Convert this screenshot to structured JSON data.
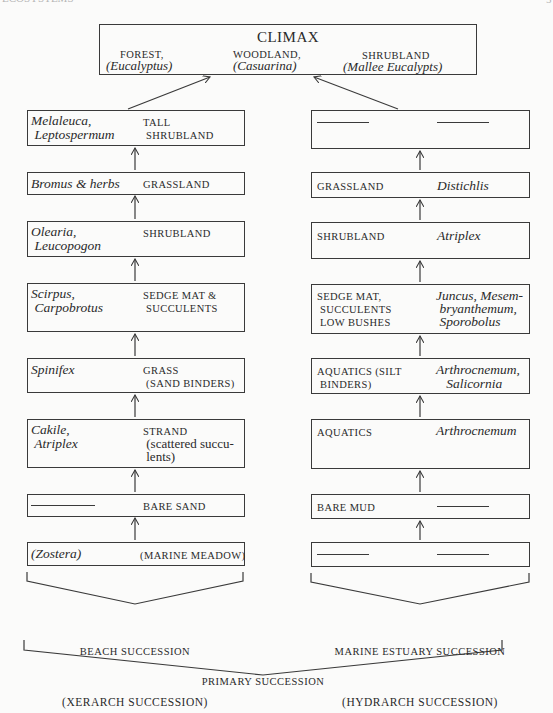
{
  "page": {
    "header_left_fragment": "ECOSYSTEMS",
    "header_right_fragment": "5"
  },
  "climax": {
    "title": "CLIMAX",
    "items": [
      {
        "type": "FOREST,",
        "genus": "(Eucalyptus)"
      },
      {
        "type": "WOODLAND,",
        "genus": "(Casuarina)"
      },
      {
        "type": "SHRUBLAND",
        "genus": "(Mallee Eucalypts)"
      }
    ]
  },
  "beach": {
    "stages": [
      {
        "species": [
          "Melaleuca,",
          " Leptospermum"
        ],
        "community": [
          "TALL",
          " SHRUBLAND"
        ]
      },
      {
        "species": [
          "Bromus & herbs"
        ],
        "community": [
          "GRASSLAND"
        ]
      },
      {
        "species": [
          "Olearia,",
          " Leucopogon"
        ],
        "community": [
          "SHRUBLAND"
        ]
      },
      {
        "species": [
          "Scirpus,",
          " Carpobrotus"
        ],
        "community": [
          "SEDGE MAT &",
          " SUCCULENTS"
        ]
      },
      {
        "species": [
          "Spinifex"
        ],
        "community": [
          "GRASS",
          " (SAND BINDERS)"
        ]
      },
      {
        "species": [
          "Cakile,",
          " Atriplex"
        ],
        "community": [
          "STRAND"
        ],
        "note": [
          " (scattered succu-",
          " lents)"
        ]
      },
      {
        "species": [
          "—"
        ],
        "community": [
          "BARE SAND"
        ]
      },
      {
        "species": [
          "(Zostera)"
        ],
        "community": [
          "(MARINE MEADOW)"
        ]
      }
    ],
    "label": [
      "BEACH SUCCESSION",
      "(XERARCH SUCCESSION)"
    ]
  },
  "estuary": {
    "stages": [
      {
        "community": [
          "—"
        ],
        "species": [
          "—"
        ]
      },
      {
        "community": [
          "GRASSLAND"
        ],
        "species": [
          "Distichlis"
        ]
      },
      {
        "community": [
          "SHRUBLAND"
        ],
        "species": [
          "Atriplex"
        ]
      },
      {
        "community": [
          "SEDGE MAT,",
          " SUCCULENTS",
          " LOW BUSHES"
        ],
        "species": [
          "Juncus, Mesem-",
          " bryanthemum,",
          " Sporobolus"
        ]
      },
      {
        "community": [
          "AQUATICS (SILT",
          " BINDERS)"
        ],
        "species": [
          "Arthrocnemum,",
          "   Salicornia"
        ]
      },
      {
        "community": [
          "AQUATICS"
        ],
        "species": [
          "Arthrocnemum"
        ]
      },
      {
        "community": [
          "BARE MUD"
        ],
        "species": [
          "—"
        ]
      },
      {
        "community": [
          "—"
        ],
        "species": [
          "—"
        ]
      }
    ],
    "label": [
      "MARINE ESTUARY SUCCESSION",
      "(HYDRARCH SUCCESSION)"
    ]
  },
  "footer": {
    "label": "PRIMARY SUCCESSION"
  }
}
